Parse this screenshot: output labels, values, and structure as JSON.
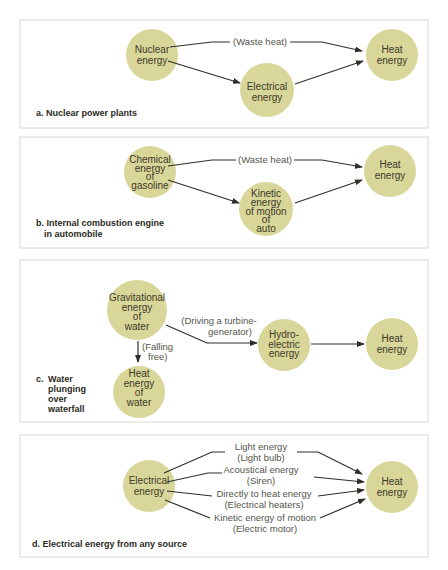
{
  "panels": [
    {
      "id": "a",
      "caption": [
        "a. Nuclear power plants"
      ],
      "nodes": {
        "source": [
          "Nuclear",
          "energy"
        ],
        "middle": [
          "Electrical",
          "energy"
        ],
        "target": [
          "Heat",
          "energy"
        ]
      },
      "edge_labels": {
        "waste": "(Waste heat)"
      }
    },
    {
      "id": "b",
      "caption": [
        "b. Internal combustion engine",
        "in automobile"
      ],
      "nodes": {
        "source": [
          "Chemical",
          "energy",
          "of",
          "gasoline"
        ],
        "middle": [
          "Kinetic",
          "energy",
          "of motion",
          "of",
          "auto"
        ],
        "target": [
          "Heat",
          "energy"
        ]
      },
      "edge_labels": {
        "waste": "(Waste heat)"
      }
    },
    {
      "id": "c",
      "caption": [
        "c.",
        "Water",
        "plunging",
        "over",
        "waterfall"
      ],
      "nodes": {
        "source": [
          "Gravitational",
          "energy",
          "of",
          "water"
        ],
        "falling": [
          "Heat",
          "energy",
          "of",
          "water"
        ],
        "middle": [
          "Hydro-",
          "electric",
          "energy"
        ],
        "target": [
          "Heat",
          "energy"
        ]
      },
      "edge_labels": {
        "falling": [
          "(Falling",
          "free)"
        ],
        "turbine": [
          "(Driving a turbine-",
          "generator)"
        ]
      }
    },
    {
      "id": "d",
      "caption": [
        "d. Electrical energy from any source"
      ],
      "nodes": {
        "source": [
          "Electrical",
          "energy"
        ],
        "target": [
          "Heat",
          "energy"
        ]
      },
      "paths": [
        {
          "label": "Light energy",
          "sub": "(Light bulb)"
        },
        {
          "label": "Acoustical energy",
          "sub": "(Siren)"
        },
        {
          "label": "Directly to heat energy",
          "sub": "(Electrical heaters)"
        },
        {
          "label": "Kinetic energy of motion",
          "sub": "(Electric motor)"
        }
      ]
    }
  ],
  "colors": {
    "node_fill": "#d9d69a",
    "edge": "#2e2e2a",
    "border": "#d8d8d0"
  }
}
